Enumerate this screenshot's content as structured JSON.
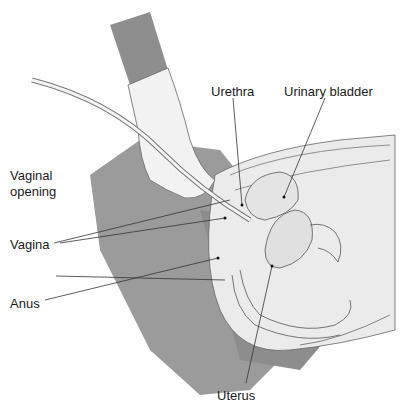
{
  "diagram": {
    "labels": {
      "urethra": "Urethra",
      "urinary_bladder": "Urinary bladder",
      "vaginal_opening_line1": "Vaginal",
      "vaginal_opening_line2": "opening",
      "vagina": "Vagina",
      "anus": "Anus",
      "uterus": "Uterus"
    },
    "colors": {
      "drape": "#9a9a9a",
      "drape_dark": "#8a8a8a",
      "body": "#ececec",
      "glove": "#f0f0f0",
      "sleeve": "#8e8e8e",
      "outline": "#555555",
      "leader": "#333333"
    }
  }
}
